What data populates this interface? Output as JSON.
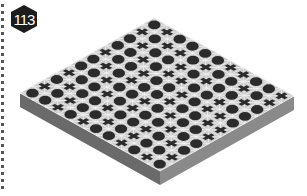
{
  "puzzle": {
    "number": "113",
    "badge_color": "#1c1c1c",
    "grid_size": 11,
    "colors": {
      "top_surface": "#c9c9c9",
      "grid_lines": "#f2f2f2",
      "piece": "#2b2b2b",
      "side_left": "#6a6a6a",
      "side_right": "#8a8a8a"
    },
    "legend": {
      "O": "circle",
      "X": "cross"
    },
    "rows": [
      "OXOOOOXXOOX",
      "XOXXOXOOXOX",
      "OXOOXOXOOXO",
      "OOXOXXOOXOO",
      "XOOXOOXOXXO",
      "OXOXOOXOOXX",
      "OOXOOXOXOOX",
      "XOOXOXOOXOO",
      "OXOOXOOXOXO",
      "XOXOOXOXOOX",
      "OOXOXOOXOXO"
    ]
  }
}
